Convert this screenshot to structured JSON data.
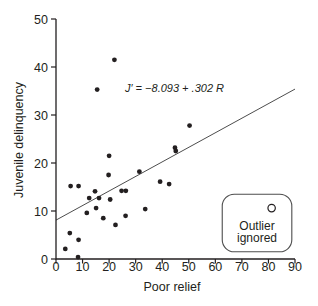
{
  "figure": {
    "background": "#ffffff",
    "ink_color": "#231f20",
    "line_color": "#4d4d4d"
  },
  "chart_data": {
    "type": "scatter",
    "title": "",
    "xlabel": "Poor relief",
    "ylabel": "Juvenile delinquency",
    "xlim": [
      0,
      90
    ],
    "ylim": [
      0,
      50
    ],
    "xticks": [
      0,
      10,
      20,
      30,
      40,
      50,
      60,
      70,
      80,
      90
    ],
    "yticks": [
      0,
      10,
      20,
      30,
      40,
      50
    ],
    "grid": false,
    "series": [
      {
        "name": "observations",
        "marker": "filled-circle",
        "color": "#231f20",
        "points": [
          [
            22,
            41.5
          ],
          [
            15.5,
            35.3
          ],
          [
            50.3,
            27.8
          ],
          [
            44.8,
            23.2
          ],
          [
            45.1,
            22.5
          ],
          [
            20,
            21.5
          ],
          [
            31.4,
            18.2
          ],
          [
            19.8,
            17.5
          ],
          [
            39.2,
            16.1
          ],
          [
            42.6,
            15.6
          ],
          [
            5.5,
            15.2
          ],
          [
            8.5,
            15.2
          ],
          [
            14.7,
            14.1
          ],
          [
            24.7,
            14.2
          ],
          [
            26.3,
            14.2
          ],
          [
            12.5,
            12.7
          ],
          [
            16.2,
            12.7
          ],
          [
            20.4,
            12.4
          ],
          [
            15.1,
            10.6
          ],
          [
            11.6,
            9.6
          ],
          [
            33.6,
            10.4
          ],
          [
            26.2,
            9.0
          ],
          [
            17.8,
            8.5
          ],
          [
            22.4,
            7.1
          ],
          [
            5.2,
            5.4
          ],
          [
            8.5,
            4.0
          ],
          [
            3.5,
            2.1
          ],
          [
            8.3,
            0.4
          ]
        ]
      }
    ],
    "regression": {
      "equation": "J′ = −8.093 + .302 R",
      "x1": 0,
      "y1": 8.1,
      "x2": 90,
      "y2": 35.4
    },
    "outlier": {
      "marker": "open-circle",
      "x": 81.2,
      "y": 10.6,
      "label_line1": "Outlier",
      "label_line2": "ignored",
      "box": {
        "x1": 62.6,
        "y1": 1.5,
        "x2": 88.8,
        "y2": 13.5
      }
    }
  }
}
